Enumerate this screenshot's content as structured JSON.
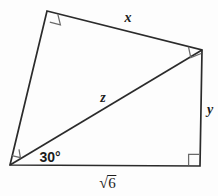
{
  "figure": {
    "type": "geometry-diagram",
    "shape": "quadrilateral-with-diagonal",
    "colors": {
      "background": "#fdfdfd",
      "stroke": "#2b2b2b",
      "text": "#1c1c1c"
    },
    "stroke_width": 1.6,
    "vertices": [
      {
        "name": "top-left",
        "x": 47,
        "y": 11
      },
      {
        "name": "top-right",
        "x": 202,
        "y": 50
      },
      {
        "name": "bottom-right",
        "x": 200,
        "y": 166
      },
      {
        "name": "bottom-left",
        "x": 10,
        "y": 165
      }
    ],
    "edges": [
      {
        "name": "top-edge",
        "from": "top-left",
        "to": "top-right",
        "label": "x"
      },
      {
        "name": "right-edge",
        "from": "top-right",
        "to": "bottom-right",
        "label": "y"
      },
      {
        "name": "bottom-edge",
        "from": "bottom-right",
        "to": "bottom-left",
        "label": "sqrt6"
      },
      {
        "name": "left-edge",
        "from": "bottom-left",
        "to": "top-left",
        "label": ""
      },
      {
        "name": "diagonal",
        "from": "bottom-left",
        "to": "top-right",
        "label": "z"
      }
    ],
    "labels": {
      "x": {
        "text": "x",
        "x": 128,
        "y": 18,
        "style": "italic"
      },
      "y": {
        "text": "y",
        "x": 210,
        "y": 110,
        "style": "italic"
      },
      "z": {
        "text": "z",
        "x": 103,
        "y": 98,
        "style": "italic"
      },
      "angle": {
        "text": "30°",
        "x": 50,
        "y": 157,
        "style": "bold"
      },
      "side_bottom": {
        "radical": "√",
        "radicand": "6",
        "text": "√6",
        "x": 108,
        "y": 183,
        "style": "radical"
      }
    },
    "right_angle_marks": [
      {
        "name": "right-angle-top-left",
        "vertex": "top-left",
        "size": 11
      },
      {
        "name": "right-angle-top-right",
        "vertex": "top-right",
        "size": 11
      },
      {
        "name": "right-angle-bottom-right",
        "vertex": "bottom-right",
        "size": 11
      },
      {
        "name": "right-angle-bottom-left",
        "vertex": "bottom-left",
        "size": 9
      }
    ],
    "angles": [
      {
        "name": "angle-30-degrees",
        "vertex": "bottom-left",
        "value": 30,
        "unit": "degrees",
        "label": "30°"
      }
    ]
  }
}
